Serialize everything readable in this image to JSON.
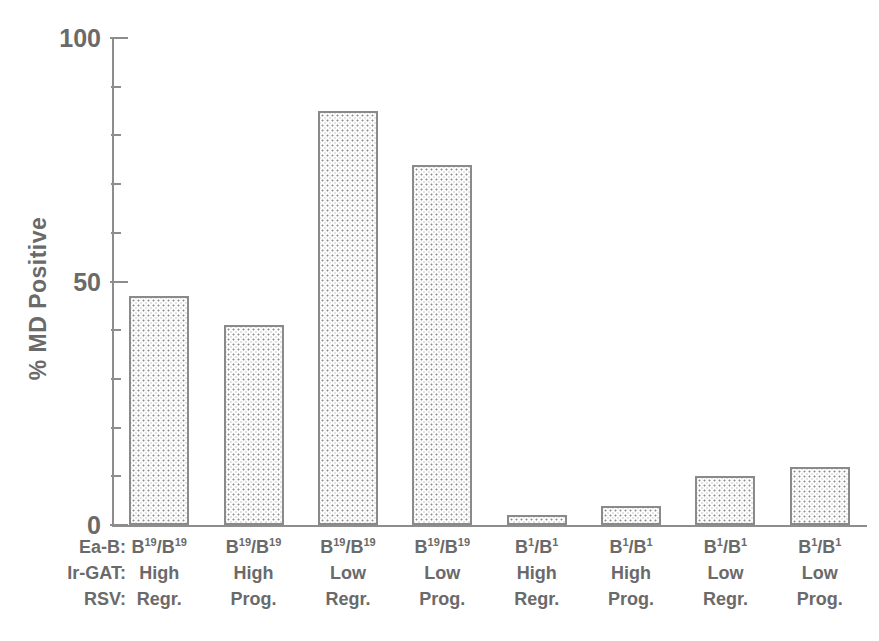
{
  "chart": {
    "type": "bar",
    "title": "",
    "ylabel": "% MD Positive",
    "xlabel": "",
    "ylim": [
      0,
      100
    ],
    "y_major_ticks": [
      0,
      50,
      100
    ],
    "y_minor_tick_step": 10,
    "grid": false,
    "legend": false,
    "row_headers": [
      "Ea-B:",
      "Ir-GAT:",
      "RSV:"
    ],
    "categories": [
      "B19/B19 High Regr.",
      "B19/B19 High Prog.",
      "B19/B19 Low Regr.",
      "B19/B19 Low Prog.",
      "B1/B1 High Regr.",
      "B1/B1 High Prog.",
      "B1/B1 Low Regr.",
      "B1/B1 Low Prog."
    ],
    "values": [
      47,
      41,
      85,
      74,
      2,
      4,
      10,
      12
    ],
    "columns": [
      {
        "eab_base": "B",
        "eab_sup": "19",
        "eab_base2": "B",
        "eab_sup2": "19",
        "irgat": "High",
        "rsv": "Regr."
      },
      {
        "eab_base": "B",
        "eab_sup": "19",
        "eab_base2": "B",
        "eab_sup2": "19",
        "irgat": "High",
        "rsv": "Prog."
      },
      {
        "eab_base": "B",
        "eab_sup": "19",
        "eab_base2": "B",
        "eab_sup2": "19",
        "irgat": "Low",
        "rsv": "Regr."
      },
      {
        "eab_base": "B",
        "eab_sup": "19",
        "eab_base2": "B",
        "eab_sup2": "19",
        "irgat": "Low",
        "rsv": "Prog."
      },
      {
        "eab_base": "B",
        "eab_sup": "1",
        "eab_base2": "B",
        "eab_sup2": "1",
        "irgat": "High",
        "rsv": "Regr."
      },
      {
        "eab_base": "B",
        "eab_sup": "1",
        "eab_base2": "B",
        "eab_sup2": "1",
        "irgat": "High",
        "rsv": "Prog."
      },
      {
        "eab_base": "B",
        "eab_sup": "1",
        "eab_base2": "B",
        "eab_sup2": "1",
        "irgat": "Low",
        "rsv": "Regr."
      },
      {
        "eab_base": "B",
        "eab_sup": "1",
        "eab_base2": "B",
        "eab_sup2": "1",
        "irgat": "Low",
        "rsv": "Prog."
      }
    ],
    "tick_labels": {
      "top": "100",
      "middle": "50",
      "bottom": "0"
    },
    "colors": {
      "axis": "#8d8d8d",
      "bar_border": "#8a8a8a",
      "bar_fill_dot": "#8e8e8e",
      "bar_fill_background": "#fdfdfd",
      "text": "#6a6a6a",
      "page_background": "#ffffff"
    }
  }
}
